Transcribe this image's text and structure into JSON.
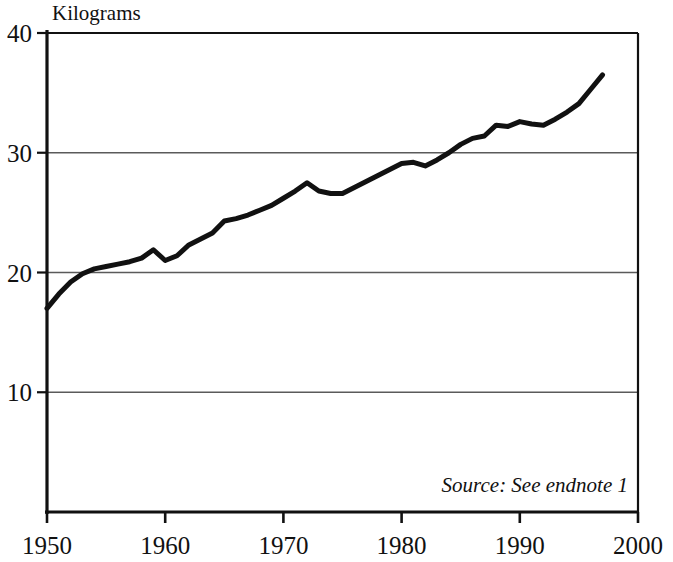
{
  "chart_data": {
    "type": "line",
    "title": "",
    "subtitle": "",
    "xlabel": "",
    "ylabel": "Kilograms",
    "ylabel_position": "top-left-above-axis",
    "xlim": [
      1950,
      2000
    ],
    "ylim": [
      0,
      40
    ],
    "yticks": [
      10,
      20,
      30,
      40
    ],
    "ytick_labels": [
      "10",
      "20",
      "30",
      "40"
    ],
    "xticks": [
      1950,
      1960,
      1970,
      1980,
      1990,
      2000
    ],
    "xtick_labels": [
      "1950",
      "1960",
      "1970",
      "1980",
      "1990",
      "2000"
    ],
    "grid": "horizontal",
    "legend": "none",
    "line_color": "#111111",
    "line_width": 5,
    "annotation": "Source: See endnote 1",
    "annotation_position": "bottom-right-inside-plot",
    "x": [
      1950,
      1951,
      1952,
      1953,
      1954,
      1955,
      1956,
      1957,
      1958,
      1959,
      1960,
      1961,
      1962,
      1963,
      1964,
      1965,
      1966,
      1967,
      1968,
      1969,
      1970,
      1971,
      1972,
      1973,
      1974,
      1975,
      1976,
      1977,
      1978,
      1979,
      1980,
      1981,
      1982,
      1983,
      1984,
      1985,
      1986,
      1987,
      1988,
      1989,
      1990,
      1991,
      1992,
      1993,
      1994,
      1995,
      1996,
      1997
    ],
    "values": [
      17.0,
      18.2,
      19.2,
      19.9,
      20.3,
      20.5,
      20.7,
      20.9,
      21.2,
      21.9,
      21.0,
      21.4,
      22.3,
      22.8,
      23.3,
      24.3,
      24.5,
      24.8,
      25.2,
      25.6,
      26.2,
      26.8,
      27.5,
      26.8,
      26.6,
      26.6,
      27.1,
      27.6,
      28.1,
      28.6,
      29.1,
      29.2,
      28.9,
      29.4,
      30.0,
      30.7,
      31.2,
      31.4,
      32.3,
      32.2,
      32.6,
      32.4,
      32.3,
      32.8,
      33.4,
      34.1,
      35.3,
      36.5
    ],
    "ylabel_unit": "Kilograms",
    "series_name": "World meat production per person"
  },
  "axis": {
    "y_title": "Kilograms",
    "source_note": "Source: See endnote 1"
  }
}
